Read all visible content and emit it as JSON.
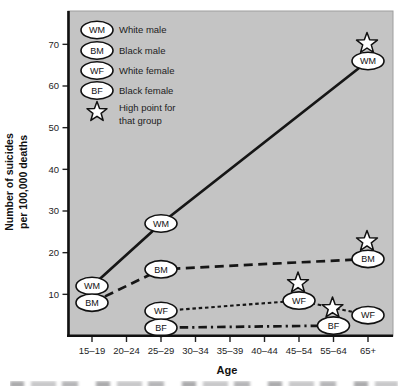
{
  "figure": {
    "xlabel": "Age",
    "ylabel_line1": "Number of suicides",
    "ylabel_line2": "per 100,000 deaths"
  },
  "chart_data": {
    "type": "line",
    "title": "",
    "xlabel": "Age",
    "ylabel": "Number of suicides per 100,000 deaths",
    "categories": [
      "15–19",
      "20–24",
      "25–29",
      "30–34",
      "35–39",
      "40–44",
      "45–54",
      "55–64",
      "65+"
    ],
    "yticks": [
      10,
      20,
      30,
      40,
      50,
      60,
      70
    ],
    "ylim": [
      0,
      78
    ],
    "grid": "off",
    "plot_background": "#c4c4c4",
    "line_color": "#161616",
    "marker_fill": "#ffffff",
    "legend_position": "top-left",
    "series": [
      {
        "name": "White male",
        "code": "WM",
        "style": "solid",
        "points": [
          {
            "age": "15–19",
            "value": 12
          },
          {
            "age": "25–29",
            "value": 27
          },
          {
            "age": "65+",
            "value": 66
          }
        ],
        "high_point": {
          "age": "65+",
          "value": 66
        }
      },
      {
        "name": "Black male",
        "code": "BM",
        "style": "long-dash",
        "points": [
          {
            "age": "15–19",
            "value": 8
          },
          {
            "age": "25–29",
            "value": 16
          },
          {
            "age": "65+",
            "value": 18.5
          }
        ],
        "high_point": {
          "age": "65+",
          "value": 18.5
        }
      },
      {
        "name": "White female",
        "code": "WF",
        "style": "short-dash",
        "points": [
          {
            "age": "25–29",
            "value": 6
          },
          {
            "age": "45–54",
            "value": 8.5
          },
          {
            "age": "65+",
            "value": 5
          }
        ],
        "high_point": {
          "age": "45–54",
          "value": 8.5
        }
      },
      {
        "name": "Black female",
        "code": "BF",
        "style": "dash-dot",
        "points": [
          {
            "age": "25–29",
            "value": 2
          },
          {
            "age": "55–64",
            "value": 2.5
          }
        ],
        "high_point": {
          "age": "55–64",
          "value": 2.5
        }
      }
    ],
    "legend": {
      "items": [
        {
          "symbol": "ellipse",
          "code": "WM",
          "label": "White male"
        },
        {
          "symbol": "ellipse",
          "code": "BM",
          "label": "Black male"
        },
        {
          "symbol": "ellipse",
          "code": "WF",
          "label": "White female"
        },
        {
          "symbol": "ellipse",
          "code": "BF",
          "label": "Black female"
        },
        {
          "symbol": "star",
          "label": "High point for that group",
          "label_lines": [
            "High point for",
            "that group"
          ]
        }
      ]
    }
  }
}
